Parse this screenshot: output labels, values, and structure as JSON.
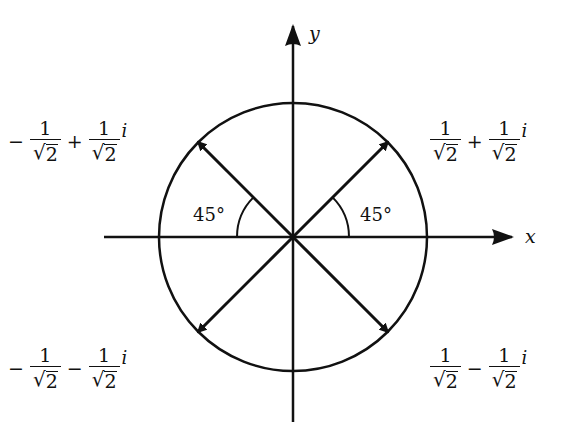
{
  "axes": {
    "x_label": "x",
    "y_label": "y"
  },
  "angles": {
    "left": "45°",
    "right": "45°"
  },
  "unit_circle_radius": 1,
  "points": [
    {
      "name": "q1",
      "re": 0.7071,
      "im": 0.7071,
      "sign1": "",
      "num1": "1",
      "den1": "2",
      "op": "+",
      "num2": "1",
      "den2": "2",
      "unit": "i"
    },
    {
      "name": "q2",
      "re": -0.7071,
      "im": 0.7071,
      "sign1": "−",
      "num1": "1",
      "den1": "2",
      "op": "+",
      "num2": "1",
      "den2": "2",
      "unit": "i"
    },
    {
      "name": "q3",
      "re": -0.7071,
      "im": -0.7071,
      "sign1": "−",
      "num1": "1",
      "den1": "2",
      "op": "−",
      "num2": "1",
      "den2": "2",
      "unit": "i"
    },
    {
      "name": "q4",
      "re": 0.7071,
      "im": -0.7071,
      "sign1": "",
      "num1": "1",
      "den1": "2",
      "op": "−",
      "num2": "1",
      "den2": "2",
      "unit": "i"
    }
  ],
  "sqrt_symbol": "√"
}
